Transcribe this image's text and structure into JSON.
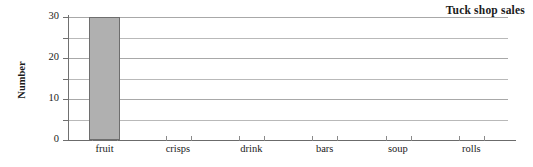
{
  "chart_data": {
    "type": "bar",
    "title": "Tuck shop sales",
    "xlabel": "",
    "ylabel": "Number",
    "categories": [
      "fruit",
      "crisps",
      "drink",
      "bars",
      "soup",
      "rolls"
    ],
    "values": [
      30,
      0,
      0,
      0,
      0,
      0
    ],
    "ylim": [
      0,
      30
    ],
    "ytick_labels": [
      "0",
      "10",
      "20",
      "30"
    ],
    "ytick_values": [
      0,
      10,
      20,
      30
    ],
    "gridline_values": [
      5,
      10,
      15,
      20,
      25,
      30
    ],
    "grid": true,
    "legend": "none",
    "bar_fill_color": "#b0b0b0",
    "bar_edge_color": "#6e6e6e",
    "gridline_color": "#b9b9b9",
    "axis_color": "#6b6b6b"
  }
}
